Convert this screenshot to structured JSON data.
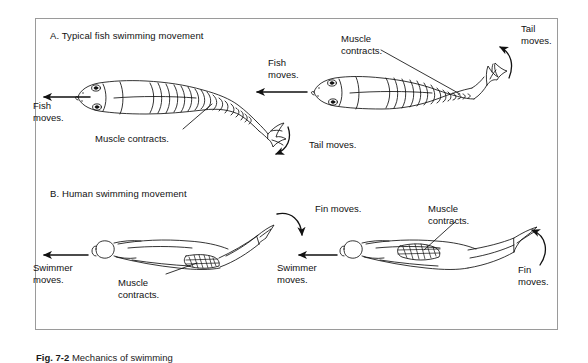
{
  "figure": {
    "caption_label": "Fig. 7-2",
    "caption_text": "Mechanics of swimming",
    "border_color": "#9a9a9a",
    "ink_color": "#111111",
    "background_color": "#ffffff"
  },
  "panels": [
    {
      "id": "A",
      "title": "A.  Typical fish swimming movement",
      "labels": [
        {
          "name": "fish-moves-left",
          "text": "Fish\nmoves.",
          "x": 33,
          "y": 100
        },
        {
          "name": "fish-moves-middle",
          "text": "Fish\nmoves.",
          "x": 268,
          "y": 57
        },
        {
          "name": "tail-moves-lower",
          "text": "Tail moves.",
          "x": 309,
          "y": 139
        },
        {
          "name": "tail-moves-upper",
          "text": "Tail\nmoves.",
          "x": 521,
          "y": 23
        },
        {
          "name": "muscle-contracts-left",
          "text": "Muscle contracts.",
          "x": 95,
          "y": 133
        },
        {
          "name": "muscle-contracts-right",
          "text": "Muscle\ncontracts.",
          "x": 341,
          "y": 33
        }
      ]
    },
    {
      "id": "B",
      "title": "B.  Human swimming movement",
      "labels": [
        {
          "name": "swimmer-moves-left",
          "text": "Swimmer\nmoves.",
          "x": 33,
          "y": 262
        },
        {
          "name": "swimmer-moves-middle",
          "text": "Swimmer\nmoves.",
          "x": 277,
          "y": 262
        },
        {
          "name": "fin-moves-middle",
          "text": "Fin moves.",
          "x": 315,
          "y": 203
        },
        {
          "name": "fin-moves-right",
          "text": "Fin\nmoves.",
          "x": 518,
          "y": 264
        },
        {
          "name": "muscle-contracts-left-b",
          "text": "Muscle\ncontracts.",
          "x": 118,
          "y": 277
        },
        {
          "name": "muscle-contracts-right-b",
          "text": "Muscle\ncontracts.",
          "x": 428,
          "y": 203
        }
      ]
    }
  ]
}
